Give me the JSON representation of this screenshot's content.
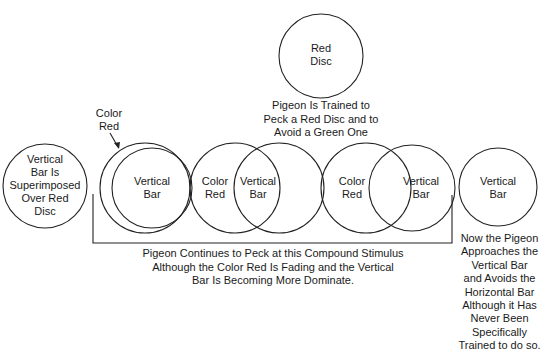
{
  "diagram": {
    "top_disc": {
      "label_line1": "Red",
      "label_line2": "Disc"
    },
    "top_caption": "Pigeon Is Trained to\nPeck a Red Disc and to\nAvoid a Green One",
    "stage1": {
      "label": "Vertical\nBar Is\nSuperimposed\nOver Red\nDisc"
    },
    "stage2": {
      "pointer_label_line1": "Color",
      "pointer_label_line2": "Red",
      "inner_label_line1": "Vertical",
      "inner_label_line2": "Bar"
    },
    "stage3": {
      "left_label_line1": "Color",
      "left_label_line2": "Red",
      "right_label_line1": "Vertical",
      "right_label_line2": "Bar"
    },
    "stage4": {
      "left_label_line1": "Color",
      "left_label_line2": "Red",
      "right_label_line1": "Vertical",
      "right_label_line2": "Bar"
    },
    "stage5": {
      "label_line1": "Vertical",
      "label_line2": "Bar"
    },
    "bracket_caption": "Pigeon Continues to Peck at this Compound Stimulus\nAlthough the Color Red  Is Fading and the Vertical\nBar Is Becoming More Dominate.",
    "final_caption": "Now the Pigeon\nApproaches the\nVertical Bar\nand Avoids the\nHorizontal Bar\nAlthough it Has\nNever Been\nSpecifically\nTrained to do so.",
    "stroke_color": "#222222",
    "background_color": "#ffffff"
  }
}
